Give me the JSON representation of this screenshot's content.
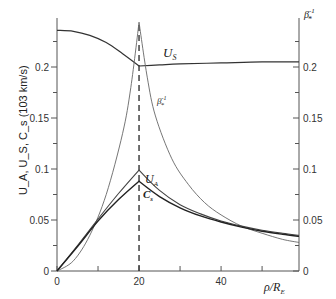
{
  "chart_data": {
    "type": "line",
    "title": "",
    "xlabel": "ρ/R_E",
    "ylabel": "U_A, U_S, C_s (10^3 km/s)",
    "ylabel_right": "β*^-1",
    "xlim": [
      0,
      59
    ],
    "ylim": [
      0,
      0.25
    ],
    "x_ticks": [
      0,
      10,
      20,
      30,
      40,
      50
    ],
    "x_tick_labels": [
      "0",
      "",
      "20",
      "",
      "40",
      ""
    ],
    "y_ticks": [
      0,
      0.025,
      0.05,
      0.075,
      0.1,
      0.125,
      0.15,
      0.175,
      0.2,
      0.225
    ],
    "y_tick_labels_left": [
      "0",
      "",
      "0.05",
      "",
      "0.1",
      "",
      "0.15",
      "",
      "0.2",
      ""
    ],
    "y_tick_labels_right": [
      "0",
      "",
      "0.05",
      "",
      "0.1",
      "",
      "0.15",
      "",
      "0.2",
      ""
    ],
    "grid": false,
    "legend": "inline curve labels",
    "vertical_reference_line": {
      "x": 20,
      "style": "dashed"
    },
    "series": [
      {
        "name": "U_s",
        "label": "U_S",
        "x": [
          0,
          4,
          8,
          12,
          16,
          20,
          25,
          30,
          40,
          50,
          59
        ],
        "values": [
          0.236,
          0.235,
          0.231,
          0.224,
          0.213,
          0.201,
          0.202,
          0.203,
          0.204,
          0.205,
          0.205
        ]
      },
      {
        "name": "beta_inv",
        "label": "β*^-1",
        "x": [
          0,
          4,
          8,
          12,
          16,
          18,
          20,
          22,
          24,
          28,
          32,
          36,
          40,
          45,
          50,
          55,
          59
        ],
        "values": [
          0,
          0.01,
          0.035,
          0.075,
          0.135,
          0.18,
          0.244,
          0.19,
          0.152,
          0.11,
          0.085,
          0.067,
          0.055,
          0.044,
          0.037,
          0.031,
          0.028
        ]
      },
      {
        "name": "U_A",
        "label": "U_A",
        "x": [
          0,
          5,
          10,
          15,
          20,
          25,
          30,
          35,
          40,
          45,
          50,
          55,
          59
        ],
        "values": [
          0,
          0.025,
          0.051,
          0.076,
          0.099,
          0.079,
          0.065,
          0.056,
          0.049,
          0.044,
          0.04,
          0.037,
          0.035
        ]
      },
      {
        "name": "C_s",
        "label": "C_s",
        "x": [
          0,
          5,
          10,
          15,
          20,
          25,
          30,
          35,
          40,
          45,
          50,
          55,
          59
        ],
        "values": [
          0,
          0.024,
          0.049,
          0.07,
          0.088,
          0.073,
          0.062,
          0.054,
          0.048,
          0.043,
          0.039,
          0.036,
          0.034
        ]
      }
    ]
  },
  "axes": {
    "x_title": "ρ/R",
    "x_title_sub": "E",
    "y_left_title": "U_A, U_S, C_s  (103 km/s)",
    "y_right_title": "β",
    "y_right_title_sup": "-1",
    "y_right_title_sub": "*"
  },
  "labels": {
    "us": "U",
    "us_sub": "S",
    "beta": "β",
    "beta_sup": "-1",
    "beta_sub": "*",
    "ua": "U",
    "ua_sub": "A",
    "cs": "C",
    "cs_sub": "s"
  }
}
